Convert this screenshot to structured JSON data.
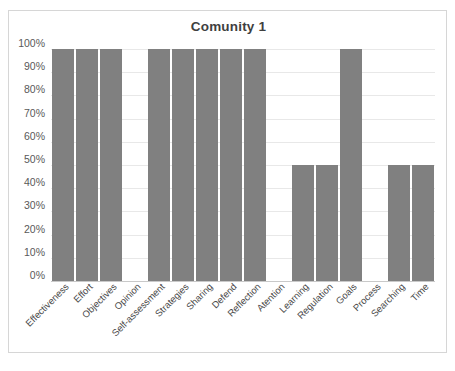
{
  "chart_data": {
    "type": "bar",
    "title": "Comunity 1",
    "xlabel": "",
    "ylabel": "",
    "ylim": [
      0,
      100
    ],
    "grid": true,
    "legend": "none",
    "bar_color": "#808080",
    "categories": [
      "Effectiveness",
      "Effort",
      "Objectives",
      "Opinion",
      "Self-assessment",
      "Strategies",
      "Sharing",
      "Defend",
      "Reflection",
      "Atention",
      "Learning",
      "Regulation",
      "Goals",
      "Process",
      "Searching",
      "Time"
    ],
    "values": [
      100,
      100,
      100,
      0,
      100,
      100,
      100,
      100,
      100,
      0,
      50,
      50,
      100,
      0,
      50,
      50
    ],
    "y_ticks": [
      {
        "value": 100,
        "label": "100%"
      },
      {
        "value": 90,
        "label": "90%"
      },
      {
        "value": 80,
        "label": "80%"
      },
      {
        "value": 70,
        "label": "70%"
      },
      {
        "value": 60,
        "label": "60%"
      },
      {
        "value": 50,
        "label": "50%"
      },
      {
        "value": 40,
        "label": "40%"
      },
      {
        "value": 30,
        "label": "30%"
      },
      {
        "value": 20,
        "label": "20%"
      },
      {
        "value": 10,
        "label": "10%"
      },
      {
        "value": 0,
        "label": "0%"
      }
    ]
  }
}
